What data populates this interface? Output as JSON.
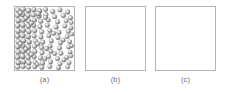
{
  "figure": {
    "background_color": "#ffffff",
    "width": 230,
    "height": 93,
    "panel_border_color": "#b3b3b3",
    "panel_fill_color": "#ffffff",
    "caption_color": "#6e6e6e",
    "particle_color": "#9a9a9a",
    "particle_highlight_color": "#f2f2f2",
    "particle_shadow_color": "#5a5a5a"
  },
  "panels": [
    {
      "id": "a",
      "caption": "(a)",
      "x": 14,
      "y": 6,
      "width": 61,
      "height": 65,
      "content": "particles",
      "description": "square box filled with shaded gray spheres, densely packed at the left edge and progressively sparser toward the right edge",
      "particle_count": 104,
      "particle_radius": 2.6,
      "gradient": "dense-left-to-sparse-right"
    },
    {
      "id": "b",
      "caption": "(b)",
      "x": 85,
      "y": 6,
      "width": 61,
      "height": 65,
      "content": "empty",
      "description": "empty square box",
      "particle_count": 0
    },
    {
      "id": "c",
      "caption": "(c)",
      "x": 155,
      "y": 6,
      "width": 61,
      "height": 65,
      "content": "empty",
      "description": "empty square box",
      "particle_count": 0
    }
  ],
  "particles": [
    {
      "cx": 3.0,
      "cy": 3.2,
      "r": 2.7
    },
    {
      "cx": 8.4,
      "cy": 2.4,
      "r": 2.6
    },
    {
      "cx": 14.0,
      "cy": 3.6,
      "r": 2.7
    },
    {
      "cx": 19.6,
      "cy": 2.8,
      "r": 2.5
    },
    {
      "cx": 25.4,
      "cy": 4.0,
      "r": 2.6
    },
    {
      "cx": 31.6,
      "cy": 2.6,
      "r": 2.4
    },
    {
      "cx": 39.0,
      "cy": 4.6,
      "r": 2.5
    },
    {
      "cx": 46.5,
      "cy": 3.0,
      "r": 2.4
    },
    {
      "cx": 54.5,
      "cy": 5.2,
      "r": 2.5
    },
    {
      "cx": 2.6,
      "cy": 8.6,
      "r": 2.6
    },
    {
      "cx": 8.0,
      "cy": 7.8,
      "r": 2.7
    },
    {
      "cx": 13.4,
      "cy": 9.0,
      "r": 2.6
    },
    {
      "cx": 19.0,
      "cy": 8.2,
      "r": 2.5
    },
    {
      "cx": 24.8,
      "cy": 9.4,
      "r": 2.6
    },
    {
      "cx": 32.0,
      "cy": 8.0,
      "r": 2.5
    },
    {
      "cx": 41.0,
      "cy": 10.0,
      "r": 2.4
    },
    {
      "cx": 50.0,
      "cy": 8.8,
      "r": 2.5
    },
    {
      "cx": 57.5,
      "cy": 11.0,
      "r": 2.4
    },
    {
      "cx": 3.4,
      "cy": 14.0,
      "r": 2.7
    },
    {
      "cx": 8.8,
      "cy": 13.2,
      "r": 2.6
    },
    {
      "cx": 14.2,
      "cy": 14.4,
      "r": 2.6
    },
    {
      "cx": 20.0,
      "cy": 13.6,
      "r": 2.5
    },
    {
      "cx": 26.6,
      "cy": 14.8,
      "r": 2.5
    },
    {
      "cx": 34.5,
      "cy": 13.4,
      "r": 2.4
    },
    {
      "cx": 44.0,
      "cy": 15.4,
      "r": 2.5
    },
    {
      "cx": 53.0,
      "cy": 14.2,
      "r": 2.4
    },
    {
      "cx": 2.8,
      "cy": 19.4,
      "r": 2.6
    },
    {
      "cx": 8.2,
      "cy": 18.6,
      "r": 2.7
    },
    {
      "cx": 13.8,
      "cy": 19.8,
      "r": 2.6
    },
    {
      "cx": 19.4,
      "cy": 19.0,
      "r": 2.5
    },
    {
      "cx": 25.8,
      "cy": 20.2,
      "r": 2.5
    },
    {
      "cx": 33.4,
      "cy": 18.8,
      "r": 2.4
    },
    {
      "cx": 42.5,
      "cy": 20.8,
      "r": 2.5
    },
    {
      "cx": 51.5,
      "cy": 19.6,
      "r": 2.4
    },
    {
      "cx": 58.0,
      "cy": 21.6,
      "r": 2.3
    },
    {
      "cx": 3.2,
      "cy": 24.8,
      "r": 2.7
    },
    {
      "cx": 8.6,
      "cy": 24.0,
      "r": 2.6
    },
    {
      "cx": 14.4,
      "cy": 25.2,
      "r": 2.6
    },
    {
      "cx": 20.4,
      "cy": 24.4,
      "r": 2.5
    },
    {
      "cx": 27.6,
      "cy": 25.6,
      "r": 2.5
    },
    {
      "cx": 36.0,
      "cy": 24.2,
      "r": 2.4
    },
    {
      "cx": 45.5,
      "cy": 26.2,
      "r": 2.4
    },
    {
      "cx": 55.0,
      "cy": 25.0,
      "r": 2.4
    },
    {
      "cx": 2.6,
      "cy": 30.2,
      "r": 2.6
    },
    {
      "cx": 8.0,
      "cy": 29.4,
      "r": 2.7
    },
    {
      "cx": 13.6,
      "cy": 30.6,
      "r": 2.6
    },
    {
      "cx": 19.8,
      "cy": 29.8,
      "r": 2.5
    },
    {
      "cx": 26.8,
      "cy": 31.0,
      "r": 2.5
    },
    {
      "cx": 35.0,
      "cy": 29.6,
      "r": 2.4
    },
    {
      "cx": 44.5,
      "cy": 31.6,
      "r": 2.4
    },
    {
      "cx": 54.0,
      "cy": 30.4,
      "r": 2.3
    },
    {
      "cx": 3.4,
      "cy": 35.6,
      "r": 2.7
    },
    {
      "cx": 8.8,
      "cy": 34.8,
      "r": 2.6
    },
    {
      "cx": 14.6,
      "cy": 36.0,
      "r": 2.6
    },
    {
      "cx": 21.0,
      "cy": 35.2,
      "r": 2.5
    },
    {
      "cx": 28.6,
      "cy": 36.4,
      "r": 2.5
    },
    {
      "cx": 37.5,
      "cy": 35.0,
      "r": 2.4
    },
    {
      "cx": 47.0,
      "cy": 37.0,
      "r": 2.4
    },
    {
      "cx": 56.5,
      "cy": 35.8,
      "r": 2.3
    },
    {
      "cx": 2.8,
      "cy": 41.0,
      "r": 2.6
    },
    {
      "cx": 8.2,
      "cy": 40.2,
      "r": 2.7
    },
    {
      "cx": 13.8,
      "cy": 41.4,
      "r": 2.6
    },
    {
      "cx": 20.2,
      "cy": 40.6,
      "r": 2.5
    },
    {
      "cx": 27.4,
      "cy": 41.8,
      "r": 2.5
    },
    {
      "cx": 36.2,
      "cy": 40.4,
      "r": 2.4
    },
    {
      "cx": 46.0,
      "cy": 42.4,
      "r": 2.4
    },
    {
      "cx": 55.5,
      "cy": 41.2,
      "r": 2.3
    },
    {
      "cx": 3.2,
      "cy": 46.4,
      "r": 2.7
    },
    {
      "cx": 8.6,
      "cy": 45.6,
      "r": 2.6
    },
    {
      "cx": 14.2,
      "cy": 46.8,
      "r": 2.6
    },
    {
      "cx": 20.6,
      "cy": 46.0,
      "r": 2.5
    },
    {
      "cx": 28.0,
      "cy": 47.2,
      "r": 2.5
    },
    {
      "cx": 37.0,
      "cy": 45.8,
      "r": 2.4
    },
    {
      "cx": 47.5,
      "cy": 47.8,
      "r": 2.4
    },
    {
      "cx": 57.0,
      "cy": 46.6,
      "r": 2.3
    },
    {
      "cx": 2.6,
      "cy": 51.8,
      "r": 2.6
    },
    {
      "cx": 8.0,
      "cy": 51.0,
      "r": 2.7
    },
    {
      "cx": 13.6,
      "cy": 52.2,
      "r": 2.6
    },
    {
      "cx": 19.8,
      "cy": 51.4,
      "r": 2.5
    },
    {
      "cx": 26.4,
      "cy": 52.6,
      "r": 2.5
    },
    {
      "cx": 34.8,
      "cy": 51.2,
      "r": 2.4
    },
    {
      "cx": 44.0,
      "cy": 53.2,
      "r": 2.4
    },
    {
      "cx": 53.5,
      "cy": 52.0,
      "r": 2.3
    },
    {
      "cx": 3.4,
      "cy": 57.2,
      "r": 2.7
    },
    {
      "cx": 8.8,
      "cy": 56.4,
      "r": 2.6
    },
    {
      "cx": 14.4,
      "cy": 57.6,
      "r": 2.6
    },
    {
      "cx": 20.8,
      "cy": 56.8,
      "r": 2.5
    },
    {
      "cx": 28.4,
      "cy": 58.0,
      "r": 2.5
    },
    {
      "cx": 36.8,
      "cy": 56.6,
      "r": 2.4
    },
    {
      "cx": 46.5,
      "cy": 58.6,
      "r": 2.4
    },
    {
      "cx": 56.0,
      "cy": 57.4,
      "r": 2.3
    },
    {
      "cx": 2.8,
      "cy": 62.0,
      "r": 2.5
    },
    {
      "cx": 8.4,
      "cy": 61.4,
      "r": 2.5
    },
    {
      "cx": 14.0,
      "cy": 62.2,
      "r": 2.4
    },
    {
      "cx": 20.4,
      "cy": 61.6,
      "r": 2.4
    },
    {
      "cx": 27.8,
      "cy": 62.4,
      "r": 2.4
    },
    {
      "cx": 36.0,
      "cy": 61.5,
      "r": 2.3
    },
    {
      "cx": 45.0,
      "cy": 62.6,
      "r": 2.3
    },
    {
      "cx": 54.5,
      "cy": 61.8,
      "r": 2.2
    },
    {
      "cx": 5.6,
      "cy": 6.0,
      "r": 2.4
    },
    {
      "cx": 11.2,
      "cy": 11.4,
      "r": 2.4
    },
    {
      "cx": 16.8,
      "cy": 16.8,
      "r": 2.4
    },
    {
      "cx": 5.6,
      "cy": 38.2,
      "r": 2.4
    },
    {
      "cx": 11.2,
      "cy": 43.6,
      "r": 2.4
    },
    {
      "cx": 17.0,
      "cy": 49.0,
      "r": 2.4
    },
    {
      "cx": 23.0,
      "cy": 59.2,
      "r": 2.3
    },
    {
      "cx": 31.0,
      "cy": 53.4,
      "r": 2.3
    },
    {
      "cx": 41.0,
      "cy": 48.0,
      "r": 2.3
    },
    {
      "cx": 50.5,
      "cy": 54.6,
      "r": 2.3
    },
    {
      "cx": 58.0,
      "cy": 50.4,
      "r": 2.2
    },
    {
      "cx": 58.5,
      "cy": 40.0,
      "r": 2.2
    },
    {
      "cx": 58.8,
      "cy": 28.0,
      "r": 2.2
    },
    {
      "cx": 58.2,
      "cy": 16.2,
      "r": 2.2
    },
    {
      "cx": 50.0,
      "cy": 34.0,
      "r": 2.3
    },
    {
      "cx": 40.0,
      "cy": 27.2,
      "r": 2.4
    },
    {
      "cx": 31.5,
      "cy": 10.8,
      "r": 2.4
    },
    {
      "cx": 32.5,
      "cy": 43.0,
      "r": 2.4
    },
    {
      "cx": 23.5,
      "cy": 38.0,
      "r": 2.5
    },
    {
      "cx": 24.0,
      "cy": 7.0,
      "r": 2.5
    }
  ]
}
